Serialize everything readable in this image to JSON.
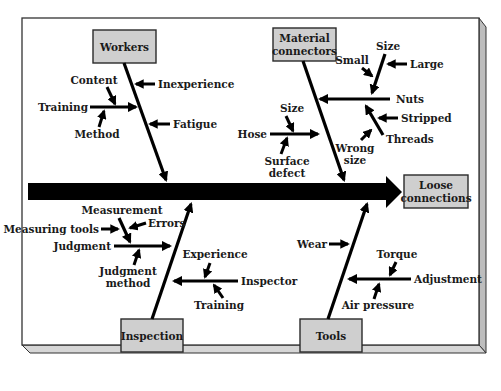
{
  "diagram": {
    "type": "fishbone",
    "effect": "Loose connections",
    "categories": {
      "workers": {
        "label": "Workers",
        "causes": {
          "inexperience": "Inexperience",
          "fatigue": "Fatigue",
          "training": "Training",
          "training_content": "Content",
          "training_method": "Method"
        }
      },
      "material_connectors": {
        "label_line1": "Material",
        "label_line2": "connectors",
        "causes": {
          "nuts": "Nuts",
          "nuts_size": "Size",
          "nuts_size_small": "Small",
          "nuts_size_large": "Large",
          "threads": "Threads",
          "threads_stripped": "Stripped",
          "threads_wrong_size_line1": "Wrong",
          "threads_wrong_size_line2": "size",
          "hose": "Hose",
          "hose_size": "Size",
          "hose_surface_defect_line1": "Surface",
          "hose_surface_defect_line2": "defect"
        }
      },
      "inspection": {
        "label": "Inspection",
        "causes": {
          "judgment": "Judgment",
          "measurement": "Measurement",
          "measuring_tools": "Measuring tools",
          "errors": "Errors",
          "judgment_method_line1": "Judgment",
          "judgment_method_line2": "method",
          "inspector": "Inspector",
          "experience": "Experience",
          "training": "Training"
        }
      },
      "tools": {
        "label": "Tools",
        "causes": {
          "wear": "Wear",
          "adjustment": "Adjustment",
          "torque": "Torque",
          "air_pressure": "Air pressure"
        }
      }
    },
    "effect_label_line1": "Loose",
    "effect_label_line2": "connections"
  }
}
